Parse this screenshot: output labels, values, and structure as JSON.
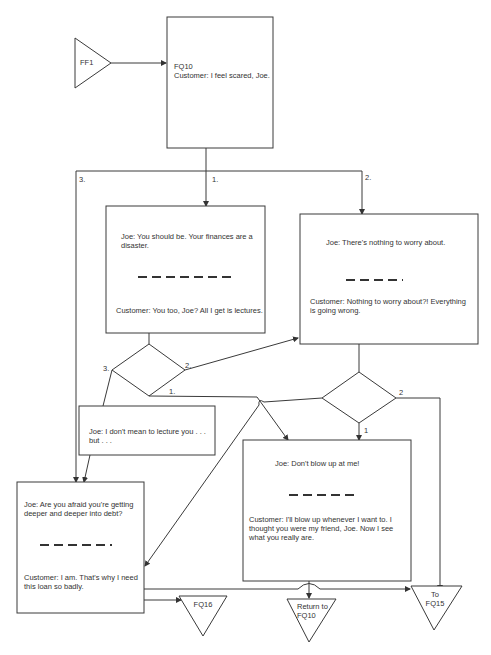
{
  "diagram": {
    "connectors": {
      "start": "FF1",
      "fq16": "FQ16",
      "return": "Return to\nFQ10",
      "to_fq15": "To\nFQ15"
    },
    "nodes": {
      "fq10": {
        "id": "FQ10",
        "text": "Customer: I feel scared, Joe."
      },
      "option1": {
        "joe": "Joe: You should be. Your finances are a disaster.",
        "customer": "Customer: You too, Joe? All I get is lectures."
      },
      "option2": {
        "joe": "Joe: There's nothing to worry about.",
        "customer": "Customer: Nothing to worry about?! Everything is going wrong."
      },
      "lecture": {
        "joe": "Joe: I don't mean to lecture you . . . but . . ."
      },
      "option3": {
        "joe": "Joe: Are you afraid you're getting deeper and deeper into debt?",
        "customer": "Customer: I am. That's why I need this loan so badly."
      },
      "blowup": {
        "joe": "Joe: Don't blow up at me!",
        "customer": "Customer: I'll blow up whenever I want to. I thought you were my friend, Joe. Now I see what you really are."
      }
    },
    "branch_labels": {
      "top_1": "1.",
      "top_2": "2.",
      "top_3": "3.",
      "d1_1": "1.",
      "d1_2": "2.",
      "d1_3": "3.",
      "d2_1": "1",
      "d2_2": "2"
    }
  }
}
